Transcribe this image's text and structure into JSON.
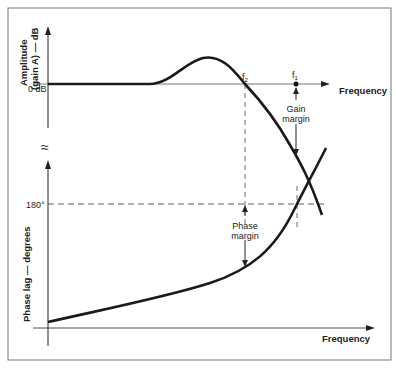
{
  "diagram": {
    "amplitude_axis_label_line1": "Amplitude",
    "amplitude_axis_label_line2": "(gain A) — dB",
    "zero_db_label": "0 dB",
    "top_frequency_label": "Frequency",
    "f2_label": "f",
    "f2_sub": "2",
    "f1_label": "f",
    "f1_sub": "1",
    "gain_margin_line1": "Gain",
    "gain_margin_line2": "margin",
    "phase_180_label": "180°",
    "phase_margin_line1": "Phase",
    "phase_margin_line2": "margin",
    "phase_axis_label": "Phase lag — degrees",
    "bottom_frequency_label": "Frequency",
    "break_symbol": "≈"
  },
  "colors": {
    "line": "#1a1a1a",
    "frame": "#555555",
    "background": "#ffffff"
  }
}
